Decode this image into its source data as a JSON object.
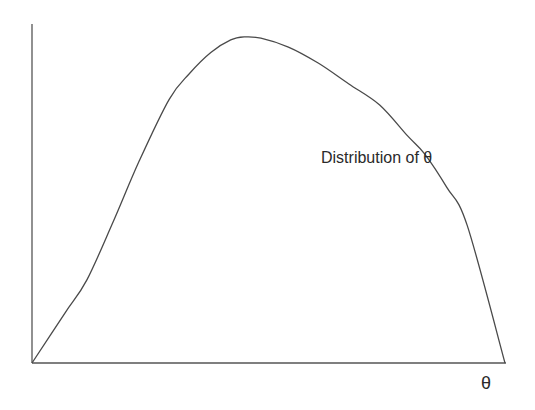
{
  "chart_data": {
    "type": "line",
    "title": "",
    "xlabel": "θ",
    "ylabel": "",
    "grid": false,
    "legend": null,
    "annotations": [
      {
        "text": "Distribution of θ",
        "position": "right of peak, upper-middle"
      }
    ],
    "axis_ticks": {
      "x": [],
      "y": []
    },
    "xlim": [
      0,
      1
    ],
    "ylim": [
      0,
      1
    ],
    "series": [
      {
        "name": "Distribution of θ",
        "x": [
          0.0,
          0.07,
          0.116,
          0.172,
          0.227,
          0.29,
          0.333,
          0.378,
          0.42,
          0.45,
          0.484,
          0.542,
          0.606,
          0.67,
          0.735,
          0.794,
          0.83,
          0.877,
          0.92,
          1.0
        ],
        "values": [
          0.0,
          0.148,
          0.245,
          0.418,
          0.597,
          0.778,
          0.854,
          0.916,
          0.953,
          0.962,
          0.958,
          0.932,
          0.884,
          0.823,
          0.761,
          0.67,
          0.617,
          0.518,
          0.406,
          0.0
        ]
      }
    ]
  },
  "labels": {
    "curve": "Distribution of θ",
    "x_axis": "θ"
  },
  "colors": {
    "line": "#4a4a4a",
    "axis": "#555555",
    "background": "#ffffff"
  }
}
